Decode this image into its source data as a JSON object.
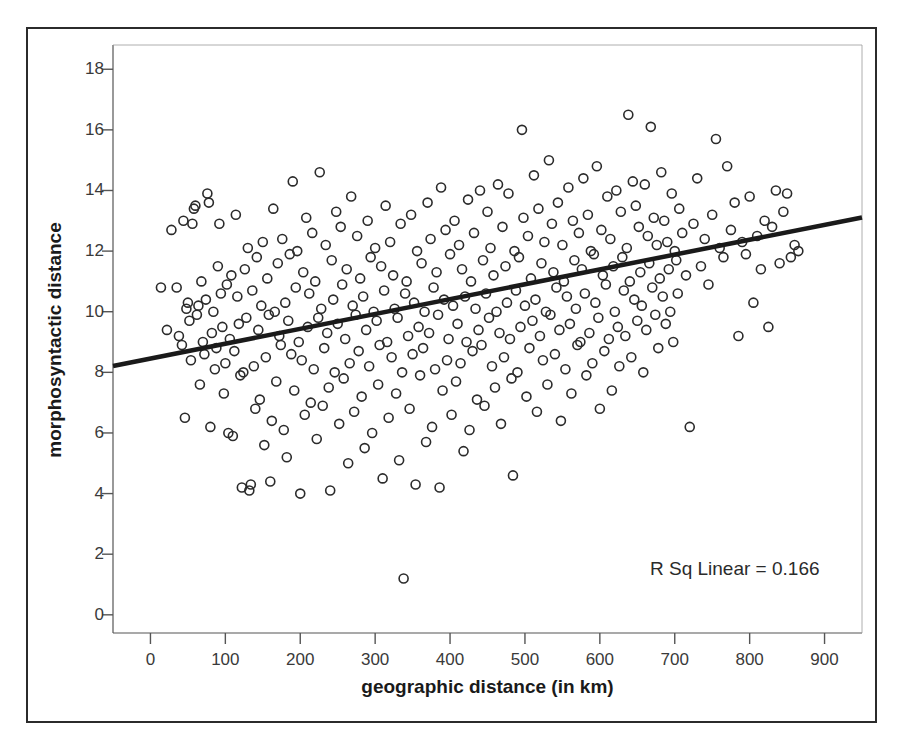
{
  "chart_data": {
    "type": "scatter",
    "title": "",
    "xlabel": "geographic distance (in km)",
    "ylabel": "morphosyntactic distance",
    "xlim": [
      -50,
      950
    ],
    "ylim": [
      -0.6,
      18.8
    ],
    "xticks": [
      0,
      100,
      200,
      300,
      400,
      500,
      600,
      700,
      800,
      900
    ],
    "yticks": [
      0,
      2,
      4,
      6,
      8,
      10,
      12,
      14,
      16,
      18
    ],
    "xtick_labels": [
      "0",
      "100",
      "200",
      "300",
      "400",
      "500",
      "600",
      "700",
      "800",
      "900"
    ],
    "ytick_labels": [
      "0",
      "2",
      "4",
      "6",
      "8",
      "10",
      "12",
      "14",
      "16",
      "18"
    ],
    "grid": false,
    "legend": null,
    "marker": "open-circle",
    "marker_size": 9,
    "marker_color": "#2b2b2b",
    "annotations": [
      {
        "text": "R Sq Linear = 0.166",
        "x": 790,
        "y": 1.6
      }
    ],
    "fit_line": {
      "type": "linear",
      "r_squared": 0.166,
      "intercept": 8.45,
      "slope": 0.0049,
      "x_start": -50,
      "x_end": 950,
      "y_start": 8.21,
      "y_end": 13.11,
      "color": "#1a1a1a",
      "width": 4.5
    },
    "points": [
      [
        14,
        10.8
      ],
      [
        22,
        9.4
      ],
      [
        28,
        12.7
      ],
      [
        35,
        10.8
      ],
      [
        38,
        9.2
      ],
      [
        42,
        8.9
      ],
      [
        44,
        13.0
      ],
      [
        46,
        6.5
      ],
      [
        48,
        10.1
      ],
      [
        50,
        10.3
      ],
      [
        52,
        9.7
      ],
      [
        54,
        8.4
      ],
      [
        56,
        12.9
      ],
      [
        58,
        13.4
      ],
      [
        60,
        13.5
      ],
      [
        62,
        9.9
      ],
      [
        64,
        10.2
      ],
      [
        66,
        7.6
      ],
      [
        68,
        11.0
      ],
      [
        70,
        9.0
      ],
      [
        72,
        8.6
      ],
      [
        74,
        10.4
      ],
      [
        76,
        13.9
      ],
      [
        78,
        13.6
      ],
      [
        80,
        6.2
      ],
      [
        82,
        9.3
      ],
      [
        84,
        10.0
      ],
      [
        86,
        8.1
      ],
      [
        88,
        8.8
      ],
      [
        90,
        11.5
      ],
      [
        92,
        12.9
      ],
      [
        94,
        10.6
      ],
      [
        96,
        9.5
      ],
      [
        98,
        7.3
      ],
      [
        100,
        8.3
      ],
      [
        102,
        10.9
      ],
      [
        104,
        6.0
      ],
      [
        106,
        9.1
      ],
      [
        108,
        11.2
      ],
      [
        110,
        5.9
      ],
      [
        112,
        8.7
      ],
      [
        114,
        13.2
      ],
      [
        116,
        10.5
      ],
      [
        118,
        9.6
      ],
      [
        120,
        7.9
      ],
      [
        122,
        4.2
      ],
      [
        124,
        8.0
      ],
      [
        126,
        11.4
      ],
      [
        128,
        9.8
      ],
      [
        130,
        12.1
      ],
      [
        132,
        4.1
      ],
      [
        134,
        4.3
      ],
      [
        136,
        10.7
      ],
      [
        138,
        8.2
      ],
      [
        140,
        6.8
      ],
      [
        142,
        11.8
      ],
      [
        144,
        9.4
      ],
      [
        146,
        7.1
      ],
      [
        148,
        10.2
      ],
      [
        150,
        12.3
      ],
      [
        152,
        5.6
      ],
      [
        154,
        8.5
      ],
      [
        156,
        11.1
      ],
      [
        158,
        9.9
      ],
      [
        160,
        4.4
      ],
      [
        162,
        6.4
      ],
      [
        164,
        13.4
      ],
      [
        166,
        10.0
      ],
      [
        168,
        7.7
      ],
      [
        170,
        11.6
      ],
      [
        172,
        9.2
      ],
      [
        174,
        8.9
      ],
      [
        176,
        12.4
      ],
      [
        178,
        6.1
      ],
      [
        180,
        10.3
      ],
      [
        182,
        5.2
      ],
      [
        184,
        9.7
      ],
      [
        186,
        11.9
      ],
      [
        188,
        8.6
      ],
      [
        190,
        14.3
      ],
      [
        192,
        7.4
      ],
      [
        194,
        10.8
      ],
      [
        196,
        12.0
      ],
      [
        198,
        9.0
      ],
      [
        200,
        4.0
      ],
      [
        202,
        8.4
      ],
      [
        204,
        11.3
      ],
      [
        206,
        6.6
      ],
      [
        208,
        13.1
      ],
      [
        210,
        9.5
      ],
      [
        212,
        10.6
      ],
      [
        214,
        7.0
      ],
      [
        216,
        12.6
      ],
      [
        218,
        8.1
      ],
      [
        220,
        11.0
      ],
      [
        222,
        5.8
      ],
      [
        224,
        9.8
      ],
      [
        226,
        14.6
      ],
      [
        228,
        10.1
      ],
      [
        230,
        6.9
      ],
      [
        232,
        8.8
      ],
      [
        234,
        12.2
      ],
      [
        236,
        9.3
      ],
      [
        238,
        7.5
      ],
      [
        240,
        4.1
      ],
      [
        242,
        11.7
      ],
      [
        244,
        10.4
      ],
      [
        246,
        8.0
      ],
      [
        248,
        13.3
      ],
      [
        250,
        9.6
      ],
      [
        252,
        6.3
      ],
      [
        254,
        12.8
      ],
      [
        256,
        10.9
      ],
      [
        258,
        7.8
      ],
      [
        260,
        9.1
      ],
      [
        262,
        11.4
      ],
      [
        264,
        5.0
      ],
      [
        266,
        8.3
      ],
      [
        268,
        13.8
      ],
      [
        270,
        10.2
      ],
      [
        272,
        6.7
      ],
      [
        274,
        9.9
      ],
      [
        276,
        12.5
      ],
      [
        278,
        8.7
      ],
      [
        280,
        11.1
      ],
      [
        282,
        7.2
      ],
      [
        284,
        10.5
      ],
      [
        286,
        5.5
      ],
      [
        288,
        9.4
      ],
      [
        290,
        13.0
      ],
      [
        292,
        8.2
      ],
      [
        294,
        11.8
      ],
      [
        296,
        6.0
      ],
      [
        298,
        10.0
      ],
      [
        300,
        12.1
      ],
      [
        302,
        9.7
      ],
      [
        304,
        7.6
      ],
      [
        306,
        8.9
      ],
      [
        308,
        11.5
      ],
      [
        310,
        4.5
      ],
      [
        312,
        10.7
      ],
      [
        314,
        13.5
      ],
      [
        316,
        9.0
      ],
      [
        318,
        6.5
      ],
      [
        320,
        12.3
      ],
      [
        322,
        8.5
      ],
      [
        324,
        11.2
      ],
      [
        326,
        10.1
      ],
      [
        328,
        7.3
      ],
      [
        330,
        9.8
      ],
      [
        332,
        5.1
      ],
      [
        334,
        12.9
      ],
      [
        336,
        8.0
      ],
      [
        338,
        1.2
      ],
      [
        340,
        10.6
      ],
      [
        342,
        11.0
      ],
      [
        344,
        9.2
      ],
      [
        346,
        6.8
      ],
      [
        348,
        13.2
      ],
      [
        350,
        8.6
      ],
      [
        352,
        10.3
      ],
      [
        354,
        4.3
      ],
      [
        356,
        12.0
      ],
      [
        358,
        9.5
      ],
      [
        360,
        7.9
      ],
      [
        362,
        11.6
      ],
      [
        364,
        8.8
      ],
      [
        366,
        10.0
      ],
      [
        368,
        5.7
      ],
      [
        370,
        13.6
      ],
      [
        372,
        9.3
      ],
      [
        374,
        12.4
      ],
      [
        376,
        6.2
      ],
      [
        378,
        10.8
      ],
      [
        380,
        8.1
      ],
      [
        382,
        11.3
      ],
      [
        384,
        9.9
      ],
      [
        386,
        4.2
      ],
      [
        388,
        14.1
      ],
      [
        390,
        7.4
      ],
      [
        392,
        10.4
      ],
      [
        394,
        12.7
      ],
      [
        396,
        8.4
      ],
      [
        398,
        9.1
      ],
      [
        400,
        11.9
      ],
      [
        402,
        6.6
      ],
      [
        404,
        10.2
      ],
      [
        406,
        13.0
      ],
      [
        408,
        7.7
      ],
      [
        410,
        9.6
      ],
      [
        412,
        12.2
      ],
      [
        414,
        8.3
      ],
      [
        416,
        11.4
      ],
      [
        418,
        5.4
      ],
      [
        420,
        10.5
      ],
      [
        422,
        9.0
      ],
      [
        424,
        13.7
      ],
      [
        426,
        6.1
      ],
      [
        428,
        11.0
      ],
      [
        430,
        8.7
      ],
      [
        432,
        12.6
      ],
      [
        434,
        10.1
      ],
      [
        436,
        7.1
      ],
      [
        438,
        9.4
      ],
      [
        440,
        14.0
      ],
      [
        442,
        8.9
      ],
      [
        444,
        11.7
      ],
      [
        446,
        6.9
      ],
      [
        448,
        10.6
      ],
      [
        450,
        13.3
      ],
      [
        452,
        9.8
      ],
      [
        454,
        12.1
      ],
      [
        456,
        8.2
      ],
      [
        458,
        11.2
      ],
      [
        460,
        7.5
      ],
      [
        462,
        10.0
      ],
      [
        464,
        14.2
      ],
      [
        466,
        9.3
      ],
      [
        468,
        6.3
      ],
      [
        470,
        12.8
      ],
      [
        472,
        8.5
      ],
      [
        474,
        11.5
      ],
      [
        476,
        10.3
      ],
      [
        478,
        13.9
      ],
      [
        480,
        9.1
      ],
      [
        482,
        7.8
      ],
      [
        484,
        4.6
      ],
      [
        486,
        12.0
      ],
      [
        488,
        10.7
      ],
      [
        490,
        8.0
      ],
      [
        492,
        11.8
      ],
      [
        494,
        9.5
      ],
      [
        496,
        16.0
      ],
      [
        498,
        13.1
      ],
      [
        500,
        10.2
      ],
      [
        502,
        7.2
      ],
      [
        504,
        12.5
      ],
      [
        506,
        8.8
      ],
      [
        508,
        11.1
      ],
      [
        510,
        9.7
      ],
      [
        512,
        14.5
      ],
      [
        514,
        10.4
      ],
      [
        516,
        6.7
      ],
      [
        518,
        13.4
      ],
      [
        520,
        9.2
      ],
      [
        522,
        11.6
      ],
      [
        524,
        8.4
      ],
      [
        526,
        12.3
      ],
      [
        528,
        10.0
      ],
      [
        530,
        7.6
      ],
      [
        532,
        15.0
      ],
      [
        534,
        9.9
      ],
      [
        536,
        12.9
      ],
      [
        538,
        11.3
      ],
      [
        540,
        8.6
      ],
      [
        542,
        10.8
      ],
      [
        544,
        13.6
      ],
      [
        546,
        9.4
      ],
      [
        548,
        6.4
      ],
      [
        550,
        12.2
      ],
      [
        552,
        11.0
      ],
      [
        554,
        8.1
      ],
      [
        556,
        10.5
      ],
      [
        558,
        14.1
      ],
      [
        560,
        9.6
      ],
      [
        562,
        7.3
      ],
      [
        564,
        13.0
      ],
      [
        566,
        11.7
      ],
      [
        568,
        10.1
      ],
      [
        570,
        8.9
      ],
      [
        572,
        12.6
      ],
      [
        574,
        9.0
      ],
      [
        576,
        11.4
      ],
      [
        578,
        14.4
      ],
      [
        580,
        10.6
      ],
      [
        582,
        7.9
      ],
      [
        584,
        13.2
      ],
      [
        586,
        9.3
      ],
      [
        588,
        12.0
      ],
      [
        590,
        8.3
      ],
      [
        592,
        11.9
      ],
      [
        594,
        10.3
      ],
      [
        596,
        14.8
      ],
      [
        598,
        9.8
      ],
      [
        600,
        6.8
      ],
      [
        602,
        12.7
      ],
      [
        604,
        11.2
      ],
      [
        606,
        8.7
      ],
      [
        608,
        10.9
      ],
      [
        610,
        13.8
      ],
      [
        612,
        9.1
      ],
      [
        614,
        12.4
      ],
      [
        616,
        7.4
      ],
      [
        618,
        11.5
      ],
      [
        620,
        10.0
      ],
      [
        622,
        14.0
      ],
      [
        624,
        9.5
      ],
      [
        626,
        8.2
      ],
      [
        628,
        13.3
      ],
      [
        630,
        11.8
      ],
      [
        632,
        10.7
      ],
      [
        634,
        9.2
      ],
      [
        636,
        12.1
      ],
      [
        638,
        16.5
      ],
      [
        640,
        11.0
      ],
      [
        642,
        8.5
      ],
      [
        644,
        14.3
      ],
      [
        646,
        10.4
      ],
      [
        648,
        13.5
      ],
      [
        650,
        9.7
      ],
      [
        652,
        12.8
      ],
      [
        654,
        11.3
      ],
      [
        656,
        10.2
      ],
      [
        658,
        8.0
      ],
      [
        660,
        14.2
      ],
      [
        662,
        9.4
      ],
      [
        664,
        12.5
      ],
      [
        666,
        11.6
      ],
      [
        668,
        16.1
      ],
      [
        670,
        10.8
      ],
      [
        672,
        13.1
      ],
      [
        674,
        9.9
      ],
      [
        676,
        12.2
      ],
      [
        678,
        8.8
      ],
      [
        680,
        11.1
      ],
      [
        682,
        14.6
      ],
      [
        684,
        10.5
      ],
      [
        686,
        13.0
      ],
      [
        688,
        9.6
      ],
      [
        690,
        12.3
      ],
      [
        692,
        11.4
      ],
      [
        694,
        10.0
      ],
      [
        696,
        13.9
      ],
      [
        698,
        9.0
      ],
      [
        700,
        12.0
      ],
      [
        702,
        11.7
      ],
      [
        704,
        10.6
      ],
      [
        706,
        13.4
      ],
      [
        710,
        12.6
      ],
      [
        715,
        11.2
      ],
      [
        720,
        6.2
      ],
      [
        725,
        12.9
      ],
      [
        730,
        14.4
      ],
      [
        735,
        11.5
      ],
      [
        740,
        12.4
      ],
      [
        745,
        10.9
      ],
      [
        750,
        13.2
      ],
      [
        755,
        15.7
      ],
      [
        760,
        12.1
      ],
      [
        765,
        11.8
      ],
      [
        770,
        14.8
      ],
      [
        775,
        12.7
      ],
      [
        780,
        13.6
      ],
      [
        785,
        9.2
      ],
      [
        790,
        12.3
      ],
      [
        795,
        11.9
      ],
      [
        800,
        13.8
      ],
      [
        805,
        10.3
      ],
      [
        810,
        12.5
      ],
      [
        815,
        11.4
      ],
      [
        820,
        13.0
      ],
      [
        825,
        9.5
      ],
      [
        830,
        12.8
      ],
      [
        835,
        14.0
      ],
      [
        840,
        11.6
      ],
      [
        845,
        13.3
      ],
      [
        850,
        13.9
      ],
      [
        855,
        11.8
      ],
      [
        860,
        12.2
      ],
      [
        865,
        12.0
      ]
    ]
  }
}
